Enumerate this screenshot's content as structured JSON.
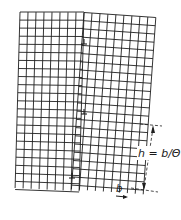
{
  "figure": {
    "colors": {
      "line": "#1e1e1e",
      "background": "#ffffff"
    }
  },
  "lattice": {
    "spacing_px": 8,
    "left_grain": {
      "columns": 8,
      "rows": 22
    },
    "right_grain": {
      "columns": 9,
      "rows": 21,
      "tilt_deg": 4
    }
  },
  "dislocations": [
    {
      "symbol": "⊥",
      "x": 84,
      "y": 44
    },
    {
      "symbol": "⊥",
      "x": 84,
      "y": 114
    },
    {
      "symbol": "⊥",
      "x": 72,
      "y": 178
    }
  ],
  "annotations": {
    "spacing_label": "h = b/Θ",
    "burgers_label": "b"
  }
}
